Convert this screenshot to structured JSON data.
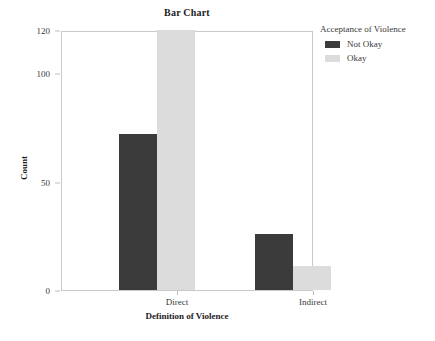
{
  "chart_data": {
    "type": "bar",
    "title": "Bar Chart",
    "xlabel": "Definition of Violence",
    "ylabel": "Count",
    "categories": [
      "Direct",
      "Indirect"
    ],
    "series": [
      {
        "name": "Not Okay",
        "color": "#3b3b3b",
        "values": [
          72,
          26
        ]
      },
      {
        "name": "Okay",
        "color": "#dcdcdc",
        "values": [
          120,
          11
        ]
      }
    ],
    "legend": {
      "title": "Acceptance of Violence",
      "position": "right",
      "entries": [
        {
          "label": "Not Okay",
          "color": "#3b3b3b"
        },
        {
          "label": "Okay",
          "color": "#dcdcdc"
        }
      ]
    },
    "yticks": [
      0,
      50,
      100,
      120
    ],
    "ylim": [
      0,
      120
    ],
    "grid": false,
    "axis_color": "#c9c9c9"
  }
}
